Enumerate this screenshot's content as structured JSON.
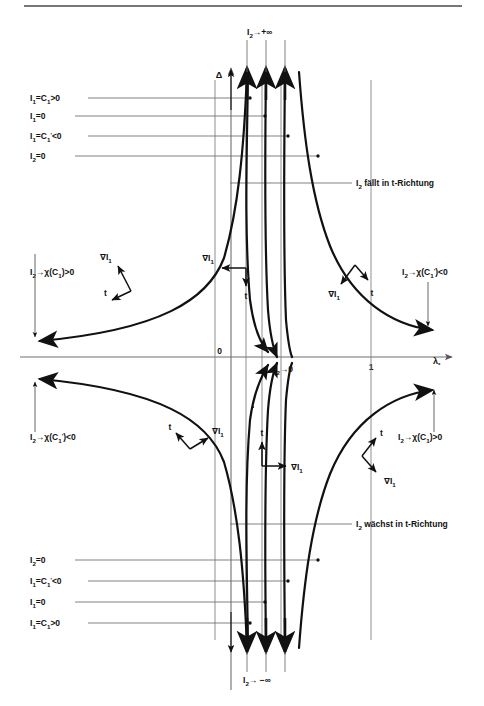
{
  "figure": {
    "axes": {
      "vertical_label": "Δ",
      "horizontal_label": "λ",
      "horizontal_label_sub": "*",
      "origin_tick": "0",
      "unit_tick": "1"
    },
    "colors": {
      "curve": "#111111",
      "guide": "#6a6a6a",
      "axis": "#555555",
      "text": "#111111",
      "background": "#ffffff"
    },
    "asymptote_labels": {
      "top_center": {
        "base": "I",
        "sub": "2",
        "arrow": "→+∞",
        "full": "I₂→+∞"
      },
      "bottom_center": {
        "base": "I",
        "sub": "2",
        "arrow": "→ −∞",
        "full": "I₂→ −∞"
      },
      "origin": {
        "base": "I",
        "sub": "2",
        "arrow": "→0",
        "full": "I₂→0"
      }
    },
    "left_guides_top": [
      {
        "id": "g-top-1",
        "text_pre": "I",
        "sub": "1",
        "text_post": "=C",
        "sub2": "1",
        "tail": ">0",
        "full": "I₁=C₁>0",
        "y": 98
      },
      {
        "id": "g-top-2",
        "text_pre": "I",
        "sub": "1",
        "text_post": "=0",
        "sub2": "",
        "tail": "",
        "full": "I₁=0",
        "y": 116
      },
      {
        "id": "g-top-3",
        "text_pre": "I",
        "sub": "1",
        "text_post": "=C",
        "sub2": "1'",
        "tail": "<0",
        "full": "I₁=C₁'<0",
        "y": 136
      },
      {
        "id": "g-top-4",
        "text_pre": "I",
        "sub": "2",
        "text_post": "=0",
        "sub2": "",
        "tail": "",
        "full": "I₂=0",
        "y": 156
      }
    ],
    "left_guides_bottom": [
      {
        "id": "g-bot-1",
        "full": "I₂=0",
        "y": 560
      },
      {
        "id": "g-bot-2",
        "full": "I₁=C₁'<0",
        "y": 581
      },
      {
        "id": "g-bot-3",
        "full": "I₁=0",
        "y": 602
      },
      {
        "id": "g-bot-4",
        "full": "I₁=C₁>0",
        "y": 623
      }
    ],
    "right_annotations": [
      {
        "id": "falls",
        "full": "I₂ fällt in t-Richtung",
        "y": 183
      },
      {
        "id": "grows",
        "full": "I₂ wächst in t-Richtung",
        "y": 524
      }
    ],
    "limit_annotations": [
      {
        "id": "upper-left",
        "full": "I₂→χ(C₁)>0",
        "x": 30,
        "y": 272
      },
      {
        "id": "upper-right",
        "full": "I₂→χ(C₁')<0",
        "x": 398,
        "y": 272
      },
      {
        "id": "lower-left",
        "full": "I₂→χ(C₁')<0",
        "x": 30,
        "y": 437
      },
      {
        "id": "lower-right",
        "full": "I₂→χ(C₁)>0",
        "x": 398,
        "y": 437
      }
    ],
    "vector_labels": [
      {
        "id": "grad-ul",
        "full": "∇I₁",
        "x": 108,
        "y": 257
      },
      {
        "id": "tan-ul",
        "full": "t",
        "x": 109,
        "y": 289
      },
      {
        "id": "grad-uc",
        "full": "∇I₁",
        "x": 228,
        "y": 256
      },
      {
        "id": "tan-uc",
        "full": "t",
        "x": 248,
        "y": 291
      },
      {
        "id": "grad-ur",
        "full": "∇I₁",
        "x": 336,
        "y": 270
      },
      {
        "id": "tan-ur",
        "full": "t",
        "x": 372,
        "y": 267
      },
      {
        "id": "tan-ll",
        "full": "t",
        "x": 172,
        "y": 437
      },
      {
        "id": "grad-ll",
        "full": "∇I₁",
        "x": 200,
        "y": 431
      },
      {
        "id": "tan-lc",
        "full": "t",
        "x": 262,
        "y": 438
      },
      {
        "id": "grad-lc",
        "full": "∇I₁",
        "x": 286,
        "y": 462
      },
      {
        "id": "tan-lr",
        "full": "t",
        "x": 375,
        "y": 437
      },
      {
        "id": "grad-lr",
        "full": "∇I₁",
        "x": 383,
        "y": 466
      }
    ],
    "curve_count": 8,
    "vertical_guide_x": [
      215,
      246,
      262,
      281,
      330,
      371
    ],
    "axis_y": 357
  }
}
